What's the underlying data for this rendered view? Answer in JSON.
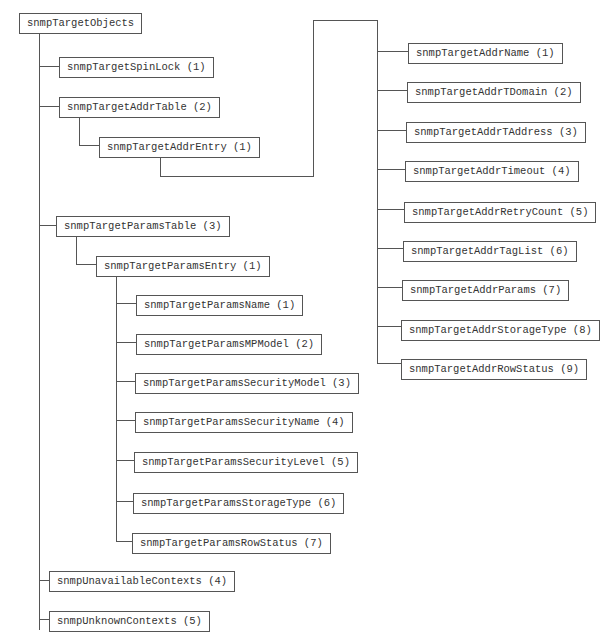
{
  "diagram": {
    "line_color": "#555555",
    "root": {
      "label": "snmpTargetObjects"
    },
    "nodes": {
      "spinlock": {
        "label": "snmpTargetSpinLock (1)"
      },
      "addr_table": {
        "label": "snmpTargetAddrTable (2)"
      },
      "addr_entry": {
        "label": "snmpTargetAddrEntry (1)"
      },
      "params_table": {
        "label": "snmpTargetParamsTable (3)"
      },
      "params_entry": {
        "label": "snmpTargetParamsEntry (1)"
      },
      "unavailable_contexts": {
        "label": "snmpUnavailableContexts (4)"
      },
      "unknown_contexts": {
        "label": "snmpUnknownContexts (5)"
      }
    },
    "addr_entry_children": [
      {
        "label": "snmpTargetAddrName (1)"
      },
      {
        "label": "snmpTargetAddrTDomain (2)"
      },
      {
        "label": "snmpTargetAddrTAddress (3)"
      },
      {
        "label": "snmpTargetAddrTimeout (4)"
      },
      {
        "label": "snmpTargetAddrRetryCount (5)"
      },
      {
        "label": "snmpTargetAddrTagList (6)"
      },
      {
        "label": "snmpTargetAddrParams (7)"
      },
      {
        "label": "snmpTargetAddrStorageType (8)"
      },
      {
        "label": "snmpTargetAddrRowStatus (9)"
      }
    ],
    "params_entry_children": [
      {
        "label": "snmpTargetParamsName (1)"
      },
      {
        "label": "snmpTargetParamsMPModel (2)"
      },
      {
        "label": "snmpTargetParamsSecurityModel (3)"
      },
      {
        "label": "snmpTargetParamsSecurityName (4)"
      },
      {
        "label": "snmpTargetParamsSecurityLevel (5)"
      },
      {
        "label": "snmpTargetParamsStorageType (6)"
      },
      {
        "label": "snmpTargetParamsRowStatus (7)"
      }
    ]
  }
}
